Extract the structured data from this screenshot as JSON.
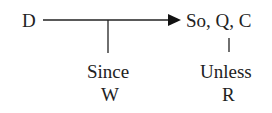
{
  "diagram": {
    "data_node": "D",
    "claim_node": "So, Q, C",
    "warrant_label": "Since",
    "warrant_node": "W",
    "rebuttal_label": "Unless",
    "rebuttal_node": "R"
  }
}
